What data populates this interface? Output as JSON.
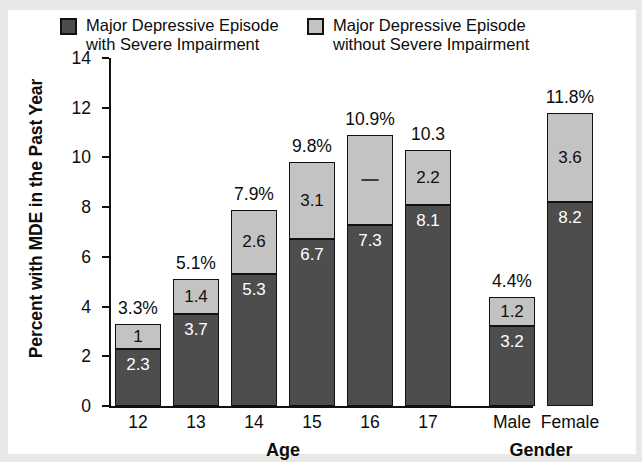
{
  "chart_data": {
    "type": "bar",
    "subtype": "stacked-bar",
    "title": "",
    "xlabel": "",
    "ylabel": "Percent with MDE in the Past Year",
    "ylim": [
      0,
      14
    ],
    "yticks": [
      0,
      2,
      4,
      6,
      8,
      10,
      12,
      14
    ],
    "ytick_labels": [
      "0",
      "2",
      "4",
      "6",
      "8",
      "10",
      "12",
      "14"
    ],
    "grid": false,
    "legend_position": "top",
    "groups": [
      {
        "name": "Age",
        "label": "Age",
        "categories": [
          "12",
          "13",
          "14",
          "15",
          "16",
          "17"
        ]
      },
      {
        "name": "Gender",
        "label": "Gender",
        "categories": [
          "Male",
          "Female"
        ]
      }
    ],
    "categories": [
      "12",
      "13",
      "14",
      "15",
      "16",
      "17",
      "Male",
      "Female"
    ],
    "series": [
      {
        "name": "Major Depressive Episode with Severe Impairment",
        "short": "with Severe Impairment",
        "color": "#4d4d4d",
        "values": [
          2.3,
          3.7,
          5.3,
          6.7,
          7.3,
          8.1,
          3.2,
          8.2
        ],
        "labels": [
          "2.3",
          "3.7",
          "5.3",
          "6.7",
          "7.3",
          "8.1",
          "3.2",
          "8.2"
        ]
      },
      {
        "name": "Major Depressive Episode without Severe Impairment",
        "short": "without Severe Impairment",
        "color": "#c3c3c3",
        "values": [
          1.0,
          1.4,
          2.6,
          3.1,
          3.6,
          2.2,
          1.2,
          3.6
        ],
        "labels": [
          "1",
          "1.4",
          "2.6",
          "3.1",
          "",
          "2.2",
          "1.2",
          "3.6"
        ]
      }
    ],
    "totals": [
      3.3,
      5.1,
      7.9,
      9.8,
      10.9,
      10.3,
      4.4,
      11.8
    ],
    "total_labels": [
      "3.3%",
      "5.1%",
      "7.9%",
      "9.8%",
      "10.9%",
      "10.3",
      "4.4%",
      "11.8%"
    ],
    "annotations": [
      {
        "category": "16",
        "series": "without Severe Impairment",
        "note": "value label rendered as a short dash in the source image"
      }
    ]
  },
  "legend": {
    "items": [
      {
        "swatch": "dark",
        "line1": "Major Depressive Episode",
        "line2": "with Severe Impairment"
      },
      {
        "swatch": "light",
        "line1": "Major Depressive Episode",
        "line2": "without Severe Impairment"
      }
    ]
  },
  "axis": {
    "y_title": "Percent with MDE in the Past Year",
    "y_ticks": [
      "14",
      "12",
      "10",
      "8",
      "6",
      "4",
      "2",
      "0"
    ],
    "x_ticks": [
      "12",
      "13",
      "14",
      "15",
      "16",
      "17",
      "Male",
      "Female"
    ],
    "group_labels": [
      "Age",
      "Gender"
    ]
  },
  "colors": {
    "dark_segment": "#4d4d4d",
    "light_segment": "#c3c3c3",
    "axis": "#111111",
    "text": "#0c0c0c",
    "plot_background": "#ffffff",
    "page_background": "#e8e8e6"
  }
}
